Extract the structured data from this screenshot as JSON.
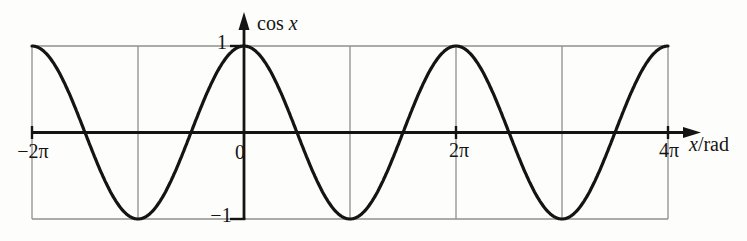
{
  "figure": {
    "background": "#fdfdfb",
    "grid_color": "#8f8f8f",
    "axis_color": "#141414",
    "curve_color": "#141414"
  },
  "labels": {
    "cos": "cos",
    "x_var": "x",
    "per_rad": "/rad",
    "one": "1",
    "zero": "0",
    "minus_one": "−1",
    "minus_two_pi": "−2π",
    "two_pi": "2π",
    "four_pi": "4π"
  },
  "chart_data": {
    "type": "line",
    "title": "",
    "ylabel": "cos x",
    "xlabel": "x/rad",
    "function": "cos(x)",
    "x_range_rad": [
      -6.283185307,
      12.566370614
    ],
    "y_range": [
      -1,
      1
    ],
    "amplitude": 1,
    "period_rad": 6.283185307,
    "grid": true,
    "legend": null,
    "key_points": [
      {
        "x": "−2π",
        "y": 1
      },
      {
        "x": "−π",
        "y": -1
      },
      {
        "x": "0",
        "y": 1
      },
      {
        "x": "π",
        "y": -1
      },
      {
        "x": "2π",
        "y": 1
      },
      {
        "x": "3π",
        "y": -1
      },
      {
        "x": "4π",
        "y": 1
      }
    ],
    "x_ticks": [
      {
        "value_rad": -6.283185307,
        "label": "−2π",
        "tick_mark": true
      },
      {
        "value_rad": 0,
        "label": "0",
        "tick_mark": false
      },
      {
        "value_rad": 6.283185307,
        "label": "2π",
        "tick_mark": true
      },
      {
        "value_rad": 12.566370614,
        "label": "4π",
        "tick_mark": true
      }
    ],
    "y_ticks": [
      {
        "value": 1,
        "label": "1"
      },
      {
        "value": -1,
        "label": "−1"
      }
    ],
    "grid_x_rad": [
      -6.283185307,
      -3.141592653,
      3.141592653,
      6.283185307,
      9.424777961,
      12.566370614
    ],
    "grid_y": [
      1,
      -1
    ]
  }
}
